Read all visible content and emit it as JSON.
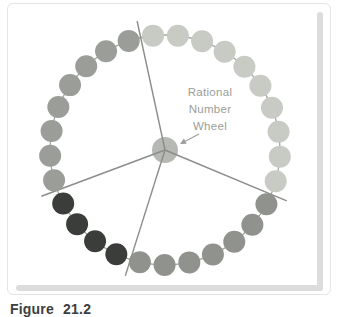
{
  "figure": {
    "caption": "Figure 21.2"
  },
  "label": {
    "line1": "Rational",
    "line2": "Number",
    "line3": "Wheel"
  },
  "wheel": {
    "center": {
      "x": 165,
      "y": 150
    },
    "ring_radius": 115,
    "dot_radius": 11,
    "dot_count": 29,
    "start_angle_deg": 96,
    "spoke_angles_deg": [
      102.2,
      200.5,
      252.5,
      337.3
    ],
    "spoke_length": 132,
    "hub_radius": 13,
    "arrow": {
      "x1": 199,
      "y1": 134,
      "x2": 180,
      "y2": 144
    },
    "sectors": [
      {
        "name": "upper-right-light",
        "from": 0,
        "to": 9,
        "color": "#c8cac4"
      },
      {
        "name": "lower-right-gray",
        "from": 10,
        "to": 16,
        "color": "#8f928d"
      },
      {
        "name": "lower-left-dark",
        "from": 17,
        "to": 20,
        "color": "#3a3d3a"
      },
      {
        "name": "upper-left-gray",
        "from": 21,
        "to": 28,
        "color": "#9a9d98"
      }
    ],
    "colors": {
      "ring": "#a3a5a0",
      "spoke": "#8a8d88",
      "hub": "#b5b8b3",
      "label": "#9a9d98"
    }
  }
}
